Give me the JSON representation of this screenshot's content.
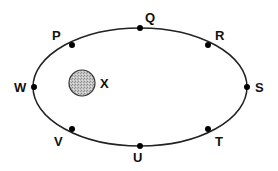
{
  "diagram": {
    "type": "orbit",
    "orbit": {
      "cx": 140,
      "cy": 87,
      "rx": 107,
      "ry": 59,
      "stroke": "#222222"
    },
    "central_body": {
      "label": "X",
      "cx": 82,
      "cy": 83,
      "r": 13,
      "fill": "#b8b8b8",
      "label_x": 100,
      "label_y": 88
    },
    "positions": [
      {
        "label": "P",
        "x": 72,
        "y": 45,
        "lx": 52,
        "ly": 40
      },
      {
        "label": "Q",
        "x": 140,
        "y": 28,
        "lx": 145,
        "ly": 22
      },
      {
        "label": "R",
        "x": 208,
        "y": 45,
        "lx": 215,
        "ly": 40
      },
      {
        "label": "S",
        "x": 247,
        "y": 87,
        "lx": 255,
        "ly": 92
      },
      {
        "label": "T",
        "x": 208,
        "y": 129,
        "lx": 215,
        "ly": 146
      },
      {
        "label": "U",
        "x": 140,
        "y": 146,
        "lx": 133,
        "ly": 162
      },
      {
        "label": "V",
        "x": 72,
        "y": 129,
        "lx": 54,
        "ly": 146
      },
      {
        "label": "W",
        "x": 34,
        "y": 87,
        "lx": 14,
        "ly": 92
      }
    ]
  }
}
